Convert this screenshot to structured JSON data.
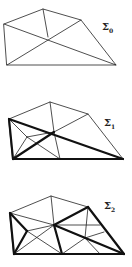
{
  "figures": [
    {
      "id": "sigma0",
      "label": "Σ",
      "subscript": "0"
    },
    {
      "id": "sigma1",
      "label": "Σ",
      "subscript": "1"
    },
    {
      "id": "sigma2",
      "label": "Σ",
      "subscript": "2"
    }
  ]
}
